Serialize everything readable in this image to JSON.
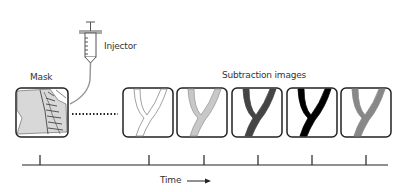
{
  "labels": {
    "injector": "Injector",
    "mask": "Mask",
    "subtraction": "Subtraction images",
    "time": "Time"
  },
  "icons": {
    "syringe": "syringe-icon",
    "time_arrow": "arrow-right-icon"
  },
  "mask_frame": {
    "content": "spine radiograph"
  },
  "subtraction_frames": [
    {
      "index": 1,
      "vessel_fill": "#ffffff",
      "vessel_stroke": "#888888",
      "contrast": "none"
    },
    {
      "index": 2,
      "vessel_fill": "#c8c8c8",
      "vessel_stroke": "#999999",
      "contrast": "low"
    },
    {
      "index": 3,
      "vessel_fill": "#444444",
      "vessel_stroke": "#444444",
      "contrast": "high"
    },
    {
      "index": 4,
      "vessel_fill": "#000000",
      "vessel_stroke": "#000000",
      "contrast": "peak"
    },
    {
      "index": 5,
      "vessel_fill": "#888888",
      "vessel_stroke": "#888888",
      "contrast": "washout"
    }
  ],
  "timeline": {
    "tick_count": 6
  }
}
